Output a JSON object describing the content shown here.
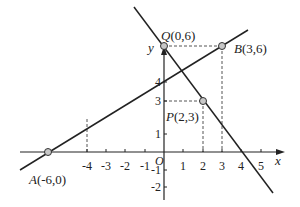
{
  "figure": {
    "type": "coordinate-plane",
    "axes": {
      "x_label": "x",
      "y_label": "y",
      "origin_label": "O",
      "x_ticks": [
        "-4",
        "-3",
        "-2",
        "-1",
        "1",
        "2",
        "3",
        "4",
        "5"
      ],
      "y_ticks": [
        "4",
        "3",
        "1",
        "-1",
        "-2"
      ]
    },
    "points": {
      "A": {
        "name": "A",
        "coords": "(-6,0)",
        "x": -6,
        "y": 0
      },
      "Q": {
        "name": "Q",
        "coords": "(0,6)",
        "x": 0,
        "y": 6
      },
      "B": {
        "name": "B",
        "coords": "(3,6)",
        "x": 3,
        "y": 6
      },
      "P": {
        "name": "P",
        "coords": "(2,3)",
        "x": 2,
        "y": 3
      }
    },
    "lines": [
      {
        "name": "line-AB",
        "through": [
          "A",
          "B"
        ]
      },
      {
        "name": "line-QP",
        "through": [
          "Q",
          "P"
        ],
        "x_intercept": 4
      }
    ],
    "guides": [
      {
        "name": "x=-4 guide"
      },
      {
        "name": "y=3 guide"
      },
      {
        "name": "x=2 guide"
      },
      {
        "name": "y=6 guide"
      },
      {
        "name": "x=3 guide"
      }
    ],
    "colors": {
      "line": "#222222",
      "point_fill": "#c8c8c8",
      "guide": "#555555"
    }
  }
}
